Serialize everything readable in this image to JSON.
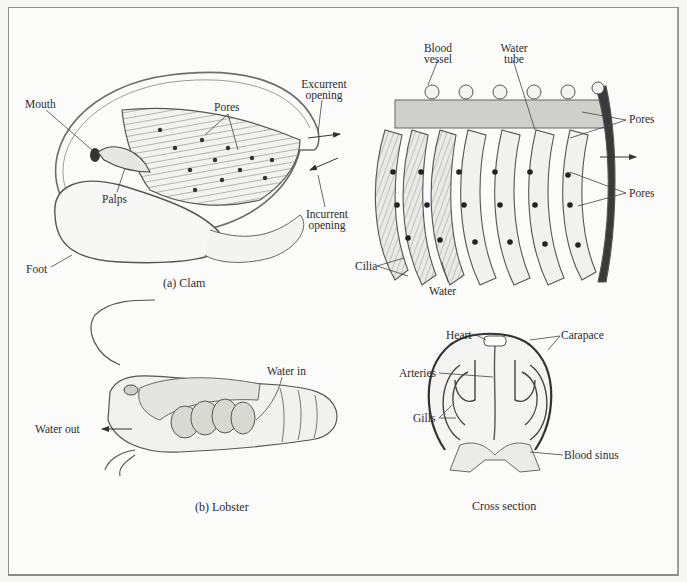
{
  "figure": {
    "panels": [
      {
        "id": "clam",
        "caption": "(a) Clam",
        "labels": {
          "mouth": "Mouth",
          "pores": "Pores",
          "excurrent_line1": "Excurrent",
          "excurrent_line2": "opening",
          "palps": "Palps",
          "incurrent_line1": "Incurrent",
          "incurrent_line2": "opening",
          "foot": "Foot"
        }
      },
      {
        "id": "gill-detail",
        "caption": "",
        "labels": {
          "blood_vessel_line1": "Blood",
          "blood_vessel_line2": "vessel",
          "water_tube_line1": "Water",
          "water_tube_line2": "tube",
          "pores_top": "Pores",
          "pores_bottom": "Pores",
          "cilia": "Cilia",
          "water": "Water"
        }
      },
      {
        "id": "lobster",
        "caption": "(b) Lobster",
        "labels": {
          "water_in": "Water in",
          "water_out": "Water out"
        }
      },
      {
        "id": "cross-section",
        "caption": "Cross section",
        "labels": {
          "heart": "Heart",
          "carapace": "Carapace",
          "arteries": "Arteries",
          "gills": "Gills",
          "blood_sinus": "Blood sinus"
        }
      }
    ]
  }
}
